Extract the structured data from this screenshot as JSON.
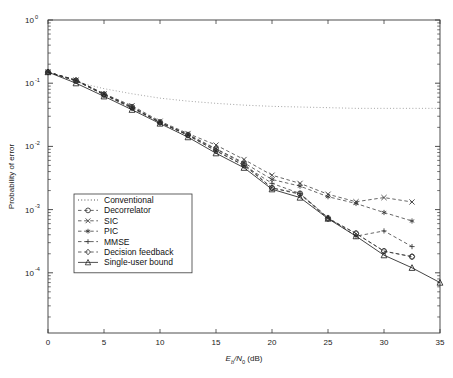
{
  "figure": {
    "background_color": "#ffffff",
    "plot_frame_color": "#3a3a3a",
    "width": 453,
    "height": 378
  },
  "axes": {
    "x": {
      "label_main": "E",
      "label_sub1": "b",
      "label_slash": "/N",
      "label_sub2": "0",
      "label_unit": " (dB)",
      "label_full": "Eb/N0 (dB)",
      "ticks": [
        0,
        5,
        10,
        15,
        20,
        25,
        30,
        35
      ],
      "tick_labels": [
        "0",
        "5",
        "10",
        "15",
        "20",
        "25",
        "30",
        "35"
      ],
      "min": 0,
      "max": 35,
      "scale": "linear"
    },
    "y": {
      "label": "Probability of error",
      "ticks_exponent": [
        0,
        -1,
        -2,
        -3,
        -4
      ],
      "tick_labels": [
        "10",
        "10",
        "10",
        "10",
        "10"
      ],
      "tick_exponents": [
        "0",
        "-1",
        "-2",
        "-3",
        "-4"
      ],
      "min": 1.1e-05,
      "max": 1.0,
      "scale": "log"
    }
  },
  "legend": {
    "position": "center-left",
    "entries": [
      {
        "label": "Conventional",
        "marker": "none",
        "line": "dotted"
      },
      {
        "label": "Decorrelator",
        "marker": "circle",
        "line": "dashed"
      },
      {
        "label": "SIC",
        "marker": "cross",
        "line": "dashed"
      },
      {
        "label": "PIC",
        "marker": "asterisk",
        "line": "dashed"
      },
      {
        "label": "MMSE",
        "marker": "plus",
        "line": "dashed"
      },
      {
        "label": "Decision feedback",
        "marker": "diamond",
        "line": "dashed"
      },
      {
        "label": "Single-user bound",
        "marker": "triangle",
        "line": "solid"
      }
    ]
  },
  "chart_data": {
    "type": "line",
    "title": "",
    "xlabel": "Eb/N0 (dB)",
    "ylabel": "Probability of error",
    "xlim": [
      0,
      35
    ],
    "ylim": [
      1.1e-05,
      1.0
    ],
    "yscale": "log",
    "grid": false,
    "legend_position": "center-left",
    "series": [
      {
        "name": "Conventional",
        "marker": "none",
        "line": "dotted",
        "color": "#9a9a9a",
        "x": [
          0,
          2.5,
          5,
          7.5,
          10,
          12.5,
          15,
          17.5,
          20,
          22.5,
          25,
          27.5,
          30,
          32.5,
          35
        ],
        "y": [
          0.15,
          0.105,
          0.082,
          0.068,
          0.058,
          0.052,
          0.048,
          0.045,
          0.043,
          0.042,
          0.041,
          0.04,
          0.04,
          0.04,
          0.04
        ]
      },
      {
        "name": "Decorrelator",
        "marker": "circle",
        "line": "dashed",
        "color": "#333333",
        "x": [
          0,
          2.5,
          5,
          7.5,
          10,
          12.5,
          15,
          17.5,
          20,
          22.5,
          25,
          27.5,
          30,
          32.5
        ],
        "y": [
          0.15,
          0.11,
          0.066,
          0.042,
          0.024,
          0.0152,
          0.009,
          0.0053,
          0.0022,
          0.0018,
          0.00073,
          0.00042,
          0.00022,
          0.00018
        ]
      },
      {
        "name": "SIC",
        "marker": "cross",
        "line": "dashed",
        "color": "#333333",
        "x": [
          0,
          2.5,
          5,
          7.5,
          10,
          12.5,
          15,
          17.5,
          20,
          22.5,
          25,
          27.5,
          30,
          32.5
        ],
        "y": [
          0.15,
          0.112,
          0.068,
          0.044,
          0.025,
          0.016,
          0.0105,
          0.0062,
          0.0035,
          0.0026,
          0.00175,
          0.00133,
          0.00155,
          0.00132
        ]
      },
      {
        "name": "PIC",
        "marker": "asterisk",
        "line": "dashed",
        "color": "#333333",
        "x": [
          0,
          2.5,
          5,
          7.5,
          10,
          12.5,
          15,
          17.5,
          20,
          22.5,
          25,
          27.5,
          30,
          32.5
        ],
        "y": [
          0.15,
          0.112,
          0.068,
          0.042,
          0.024,
          0.0155,
          0.0092,
          0.0055,
          0.003,
          0.00235,
          0.0016,
          0.00125,
          0.0009,
          0.00066
        ]
      },
      {
        "name": "MMSE",
        "marker": "plus",
        "line": "dashed",
        "color": "#333333",
        "x": [
          0,
          2.5,
          5,
          7.5,
          10,
          12.5,
          15,
          17.5,
          20,
          22.5,
          25,
          27.5,
          30,
          32.5
        ],
        "y": [
          0.15,
          0.11,
          0.066,
          0.04,
          0.024,
          0.015,
          0.0085,
          0.005,
          0.0026,
          0.0018,
          0.00075,
          0.00038,
          0.00046,
          0.00026
        ]
      },
      {
        "name": "Decision feedback",
        "marker": "diamond",
        "line": "dashed",
        "color": "#333333",
        "x": [
          0,
          2.5,
          5,
          7.5,
          10,
          12.5,
          15,
          17.5,
          20,
          22.5,
          25,
          27.5,
          30,
          32.5
        ],
        "y": [
          0.15,
          0.11,
          0.066,
          0.041,
          0.024,
          0.015,
          0.0085,
          0.005,
          0.0022,
          0.00175,
          0.00072,
          0.00042,
          0.00022,
          0.00018
        ]
      },
      {
        "name": "Single-user bound",
        "marker": "triangle",
        "line": "solid",
        "color": "#222222",
        "x": [
          0,
          2.5,
          5,
          7.5,
          10,
          12.5,
          15,
          17.5,
          20,
          22.5,
          25,
          27.5,
          30,
          32.5,
          35
        ],
        "y": [
          0.15,
          0.1,
          0.062,
          0.038,
          0.023,
          0.014,
          0.0078,
          0.0046,
          0.0021,
          0.00155,
          0.00072,
          0.00038,
          0.00019,
          0.00012,
          7e-05
        ]
      }
    ]
  }
}
